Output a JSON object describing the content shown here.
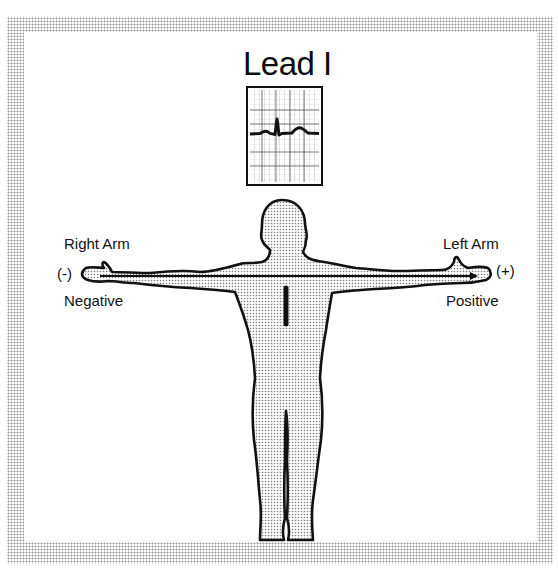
{
  "figure": {
    "title": "Lead I",
    "ecg_strip": {
      "label": "Lead I ECG tracing",
      "waves": [
        "P",
        "QRS",
        "T"
      ]
    },
    "electrodes": {
      "right_arm": {
        "label": "Right Arm",
        "polarity_symbol": "(-)",
        "polarity_text": "Negative"
      },
      "left_arm": {
        "label": "Left Arm",
        "polarity_symbol": "(+)",
        "polarity_text": "Positive"
      }
    },
    "body_figure": "human-silhouette",
    "lead_axis": "right-arm-to-left-arm",
    "heart_vector": "vertical-bar"
  },
  "colors": {
    "outline": "#111111",
    "stipple": "#8c8c8c",
    "grid": "#666666",
    "border_dots": "#9a9a9a"
  }
}
